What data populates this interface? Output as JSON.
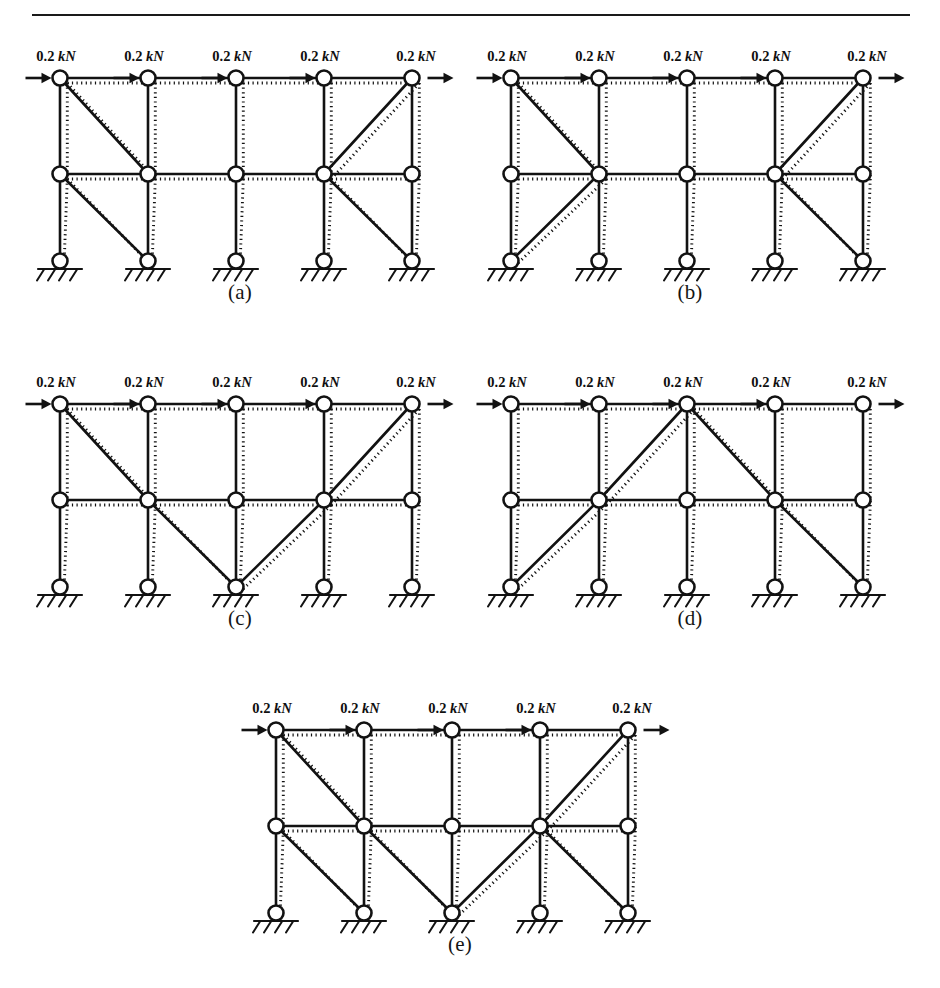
{
  "figure": {
    "load_label_value": "0.2",
    "load_label_unit": "kN",
    "load_count_per_panel": 5,
    "support_symbol": "fixed-ground-hatched",
    "line_styles": {
      "undeformed": "solid",
      "deformed": "dotted"
    },
    "colors": {
      "ink": "#121212",
      "background": "#ffffff",
      "node_fill": "#ffffff"
    }
  },
  "geometry": {
    "columns_x": [
      0,
      88,
      176,
      264,
      352
    ],
    "rows_y": {
      "top": 0,
      "middle": 96,
      "bottom": 183
    },
    "node_radius": 7.5,
    "deform_offset": 6
  },
  "panels": [
    {
      "id": "a",
      "caption": "(a)",
      "loads": [
        "0.2 kN",
        "0.2 kN",
        "0.2 kN",
        "0.2 kN",
        "0.2 kN"
      ],
      "description": "Braced outer bays: X-less single diagonals in bay 1 upper and lower, and bay 4 upper and lower",
      "braces": [
        {
          "from": "top-1",
          "to": "middle-2"
        },
        {
          "from": "middle-1",
          "to": "bottom-2"
        },
        {
          "from": "middle-4",
          "to": "top-5"
        },
        {
          "from": "middle-4",
          "to": "bottom-5"
        }
      ]
    },
    {
      "id": "b",
      "caption": "(b)",
      "loads": [
        "0.2 kN",
        "0.2 kN",
        "0.2 kN",
        "0.2 kN",
        "0.2 kN"
      ],
      "description": "Braces converging on middle nodes 2 and 4",
      "braces": [
        {
          "from": "top-1",
          "to": "middle-2"
        },
        {
          "from": "bottom-1",
          "to": "middle-2"
        },
        {
          "from": "middle-4",
          "to": "top-5"
        },
        {
          "from": "middle-4",
          "to": "bottom-5"
        }
      ]
    },
    {
      "id": "c",
      "caption": "(c)",
      "loads": [
        "0.2 kN",
        "0.2 kN",
        "0.2 kN",
        "0.2 kN",
        "0.2 kN"
      ],
      "description": "Continuous V-chain from top-left down to bottom-centre and up to top-right",
      "braces": [
        {
          "from": "top-1",
          "to": "middle-2"
        },
        {
          "from": "middle-2",
          "to": "bottom-3"
        },
        {
          "from": "bottom-3",
          "to": "middle-4"
        },
        {
          "from": "middle-4",
          "to": "top-5"
        }
      ]
    },
    {
      "id": "d",
      "caption": "(d)",
      "loads": [
        "0.2 kN",
        "0.2 kN",
        "0.2 kN",
        "0.2 kN",
        "0.2 kN"
      ],
      "description": "Continuous inverted-V chain from bottom-left up to top-centre and down to bottom-right",
      "braces": [
        {
          "from": "bottom-1",
          "to": "middle-2"
        },
        {
          "from": "middle-2",
          "to": "top-3"
        },
        {
          "from": "top-3",
          "to": "middle-4"
        },
        {
          "from": "middle-4",
          "to": "bottom-5"
        }
      ]
    },
    {
      "id": "e",
      "caption": "(e)",
      "loads": [
        "0.2 kN",
        "0.2 kN",
        "0.2 kN",
        "0.2 kN",
        "0.2 kN"
      ],
      "description": "Fully braced combination of outer bay diagonals and central V-chain",
      "braces": [
        {
          "from": "top-1",
          "to": "middle-2"
        },
        {
          "from": "middle-1",
          "to": "bottom-2"
        },
        {
          "from": "middle-2",
          "to": "bottom-3"
        },
        {
          "from": "bottom-3",
          "to": "middle-4"
        },
        {
          "from": "middle-4",
          "to": "top-5"
        },
        {
          "from": "middle-4",
          "to": "bottom-5"
        }
      ]
    }
  ]
}
